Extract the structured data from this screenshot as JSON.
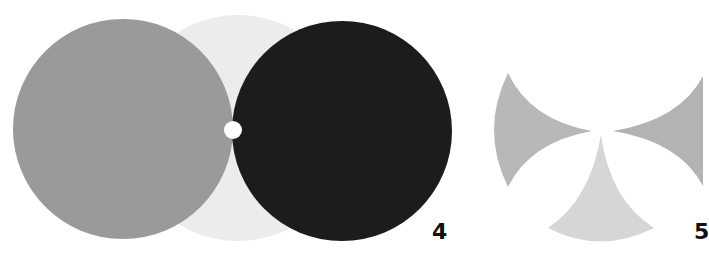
{
  "figures": [
    {
      "number": "4",
      "description": "Three overlapping circles: gray, light gray, black, with a small white dot at the junction",
      "colors": {
        "gray_circle": "#9a9a9a",
        "light_circle": "#ececec",
        "black_circle": "#1c1c1c",
        "dot": "#ffffff"
      }
    },
    {
      "number": "5",
      "description": "Three concave curved wedge shapes arranged around a central point",
      "colors": {
        "left_wedge": "#b8b8b8",
        "right_wedge": "#b3b3b3",
        "bottom_wedge": "#d6d6d6"
      }
    }
  ]
}
